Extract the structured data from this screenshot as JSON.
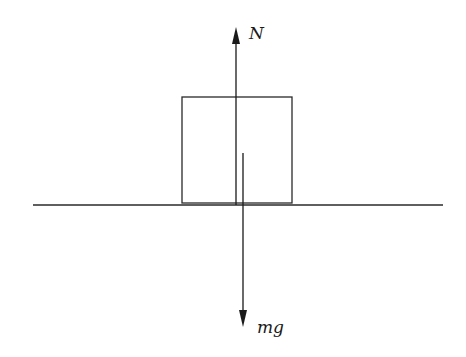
{
  "diagram": {
    "type": "free-body-diagram",
    "colors": {
      "stroke": "#2a2a2a",
      "background": "#ffffff"
    },
    "ground": {
      "x1": 33,
      "x2": 443,
      "y": 205
    },
    "block": {
      "x": 182,
      "y": 97,
      "width": 110,
      "height": 106
    },
    "forces": [
      {
        "id": "normal",
        "label": "N",
        "x": 236,
        "y_start": 205,
        "y_end": 27,
        "direction": "up",
        "label_x": 250,
        "label_y": 38
      },
      {
        "id": "weight",
        "label": "mg",
        "x": 243,
        "y_start": 153,
        "y_end": 326,
        "direction": "down",
        "label_x": 257,
        "label_y": 333
      }
    ]
  }
}
